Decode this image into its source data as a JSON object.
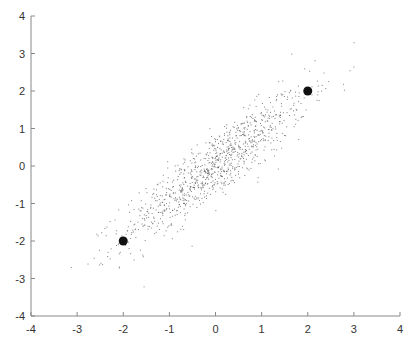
{
  "chart_data": {
    "type": "scatter",
    "title": "",
    "xlabel": "",
    "ylabel": "",
    "xlim": [
      -4,
      4
    ],
    "ylim": [
      -4,
      4
    ],
    "grid": false,
    "legend": null,
    "x_ticks": [
      -4,
      -3,
      -2,
      -1,
      0,
      1,
      2,
      3,
      4
    ],
    "y_ticks": [
      -4,
      -3,
      -2,
      -1,
      0,
      1,
      2,
      3,
      4
    ],
    "x_tick_labels": [
      "-4",
      "-3",
      "-2",
      "-1",
      "0",
      "1",
      "2",
      "3",
      "4"
    ],
    "y_tick_labels": [
      "-4",
      "-3",
      "-2",
      "-1",
      "0",
      "1",
      "2",
      "3",
      "4"
    ],
    "series": [
      {
        "name": "samples",
        "kind": "bivariate-normal-cloud",
        "n": 1000,
        "mean": [
          0,
          0
        ],
        "std": [
          1,
          1
        ],
        "correlation": 0.9,
        "marker_size": 1,
        "color": "#555555"
      },
      {
        "name": "highlighted-points",
        "points": [
          {
            "x": -2,
            "y": -2
          },
          {
            "x": 2,
            "y": 2
          }
        ],
        "marker_size": 6,
        "color": "#111111"
      }
    ],
    "axis_color": "#888888",
    "spines": [
      "left",
      "bottom"
    ]
  },
  "layout": {
    "plot_left": 31,
    "plot_right": 400,
    "plot_top": 16,
    "plot_bottom": 316
  }
}
